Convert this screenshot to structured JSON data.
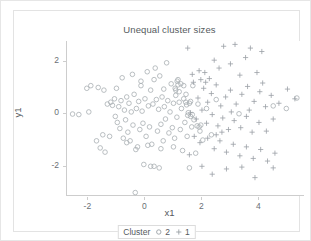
{
  "chart_data": {
    "type": "scatter",
    "title": "Unequal cluster sizes",
    "xlabel": "x1",
    "ylabel": "y1",
    "xlim": [
      -2.75,
      5.6
    ],
    "ylim": [
      -3.15,
      2.75
    ],
    "grid": false,
    "xticks": [
      "-2",
      "0",
      "2",
      "4"
    ],
    "xtick_values": [
      -2,
      0,
      2,
      4
    ],
    "yticks": [
      "2",
      "0",
      "-2"
    ],
    "ytick_values": [
      2,
      0,
      -2
    ],
    "legend": {
      "title": "Cluster",
      "position": "bottom",
      "entries": [
        {
          "label": "2",
          "marker": "circle",
          "color": "#9aa0a6"
        },
        {
          "label": "1",
          "marker": "plus",
          "color": "#9aa0a6"
        }
      ]
    },
    "series": [
      {
        "name": "2",
        "marker": "circle",
        "color": "#a8aeb3",
        "points": [
          [
            -2.52,
            -0.03
          ],
          [
            -2.3,
            -0.05
          ],
          [
            -2.02,
            0.95
          ],
          [
            -1.88,
            1.05
          ],
          [
            -1.62,
            0.98
          ],
          [
            -1.55,
            -1.32
          ],
          [
            -1.46,
            -0.82
          ],
          [
            -1.42,
            0.88
          ],
          [
            -1.38,
            -1.48
          ],
          [
            -1.3,
            0.35
          ],
          [
            -1.22,
            -0.88
          ],
          [
            -1.18,
            0.42
          ],
          [
            -1.12,
            0.3
          ],
          [
            -1.05,
            0.55
          ],
          [
            -1.02,
            -0.12
          ],
          [
            -0.98,
            0.95
          ],
          [
            -0.95,
            -0.35
          ],
          [
            -0.9,
            0.25
          ],
          [
            -0.86,
            -0.58
          ],
          [
            -0.82,
            0.48
          ],
          [
            -0.78,
            1.35
          ],
          [
            -0.74,
            -0.95
          ],
          [
            -0.7,
            0.12
          ],
          [
            -0.66,
            -0.25
          ],
          [
            -0.62,
            0.62
          ],
          [
            -0.58,
            -0.72
          ],
          [
            -0.54,
            0.38
          ],
          [
            -0.5,
            -1.05
          ],
          [
            -0.46,
            0.05
          ],
          [
            -0.42,
            1.48
          ],
          [
            -0.4,
            -0.45
          ],
          [
            -0.36,
            0.72
          ],
          [
            -0.32,
            -3.02
          ],
          [
            -0.28,
            0.18
          ],
          [
            -0.24,
            -1.28
          ],
          [
            -0.2,
            0.45
          ],
          [
            -0.16,
            -0.62
          ],
          [
            -0.12,
            1.22
          ],
          [
            -0.08,
            0.08
          ],
          [
            -0.05,
            -0.38
          ],
          [
            -0.02,
            -1.95
          ],
          [
            0.02,
            0.55
          ],
          [
            0.06,
            -0.88
          ],
          [
            0.1,
            1.58
          ],
          [
            0.14,
            0.28
          ],
          [
            0.18,
            -0.52
          ],
          [
            0.22,
            0.88
          ],
          [
            0.26,
            -1.18
          ],
          [
            0.3,
            0.35
          ],
          [
            0.34,
            -2.02
          ],
          [
            0.38,
            1.72
          ],
          [
            0.42,
            0.52
          ],
          [
            0.46,
            -0.68
          ],
          [
            0.5,
            0.15
          ],
          [
            0.54,
            1.42
          ],
          [
            0.58,
            -0.42
          ],
          [
            0.62,
            0.62
          ],
          [
            0.66,
            -1.05
          ],
          [
            0.7,
            0.25
          ],
          [
            0.74,
            -0.22
          ],
          [
            0.78,
            1.92
          ],
          [
            0.82,
            0.48
          ],
          [
            0.86,
            -0.75
          ],
          [
            0.9,
            0.05
          ],
          [
            0.94,
            1.12
          ],
          [
            0.98,
            -0.55
          ],
          [
            1.02,
            0.38
          ],
          [
            1.06,
            -0.95
          ],
          [
            1.1,
            0.68
          ],
          [
            1.14,
            -0.15
          ],
          [
            1.18,
            1.28
          ],
          [
            1.22,
            0.42
          ],
          [
            1.26,
            -0.62
          ],
          [
            1.3,
            0.18
          ],
          [
            1.34,
            -1.42
          ],
          [
            1.38,
            0.55
          ],
          [
            1.42,
            -0.35
          ],
          [
            1.46,
            0.72
          ],
          [
            1.5,
            -0.88
          ],
          [
            1.54,
            0.02
          ],
          [
            1.58,
            -2.08
          ],
          [
            1.62,
            0.45
          ],
          [
            1.66,
            -0.52
          ],
          [
            1.7,
            1.05
          ],
          [
            1.74,
            -0.25
          ],
          [
            1.8,
            -1.52
          ],
          [
            1.88,
            0.35
          ],
          [
            1.95,
            -0.68
          ],
          [
            2.05,
            -1.02
          ],
          [
            2.18,
            0.18
          ],
          [
            2.35,
            -0.82
          ],
          [
            2.52,
            0.52
          ],
          [
            3.32,
            -0.02
          ],
          [
            4.52,
            0.28
          ],
          [
            4.98,
            0.18
          ],
          [
            5.35,
            0.58
          ],
          [
            -0.62,
            -1.12
          ],
          [
            -0.3,
            -1.38
          ],
          [
            0.12,
            -1.22
          ],
          [
            0.58,
            -1.35
          ],
          [
            1.02,
            -1.28
          ],
          [
            -1.68,
            -1.05
          ],
          [
            -1.95,
            0.05
          ],
          [
            0.22,
            -2.02
          ],
          [
            0.52,
            -2.08
          ],
          [
            -0.12,
            1.05
          ],
          [
            0.34,
            1.28
          ],
          [
            0.68,
            0.92
          ],
          [
            1.08,
            0.95
          ],
          [
            1.18,
            1.08
          ],
          [
            1.22,
            0.82
          ],
          [
            1.28,
            1.12
          ],
          [
            1.38,
            1.05
          ],
          [
            1.45,
            0.42
          ],
          [
            1.48,
            0.32
          ],
          [
            1.58,
            0.38
          ],
          [
            1.52,
            -0.08
          ],
          [
            1.62,
            -0.12
          ],
          [
            1.68,
            -0.05
          ],
          [
            1.85,
            -0.48
          ],
          [
            1.92,
            -0.52
          ],
          [
            1.98,
            -0.45
          ],
          [
            1.15,
            1.22
          ],
          [
            1.1,
            0.88
          ]
        ]
      },
      {
        "name": "1",
        "marker": "plus",
        "color": "#9aa0a6",
        "points": [
          [
            1.52,
            2.48
          ],
          [
            1.92,
            1.62
          ],
          [
            2.28,
            1.32
          ],
          [
            2.45,
            2.02
          ],
          [
            2.62,
            1.72
          ],
          [
            2.78,
            2.55
          ],
          [
            3.02,
            1.88
          ],
          [
            3.18,
            2.62
          ],
          [
            3.35,
            1.45
          ],
          [
            3.55,
            2.12
          ],
          [
            3.72,
            2.48
          ],
          [
            3.95,
            1.55
          ],
          [
            4.12,
            2.35
          ],
          [
            1.72,
            1.18
          ],
          [
            1.88,
            0.58
          ],
          [
            2.08,
            0.95
          ],
          [
            2.22,
            0.42
          ],
          [
            2.35,
            0.75
          ],
          [
            2.52,
            1.08
          ],
          [
            2.68,
            0.28
          ],
          [
            2.85,
            0.62
          ],
          [
            3.02,
            0.88
          ],
          [
            3.22,
            0.35
          ],
          [
            3.42,
            0.72
          ],
          [
            3.62,
            1.02
          ],
          [
            3.85,
            0.45
          ],
          [
            4.05,
            0.82
          ],
          [
            4.25,
            0.25
          ],
          [
            4.45,
            0.68
          ],
          [
            4.72,
            0.38
          ],
          [
            5.02,
            0.92
          ],
          [
            5.28,
            0.55
          ],
          [
            1.62,
            0.02
          ],
          [
            1.82,
            -0.22
          ],
          [
            2.02,
            0.12
          ],
          [
            2.18,
            -0.38
          ],
          [
            2.38,
            -0.05
          ],
          [
            2.58,
            -0.48
          ],
          [
            2.75,
            -0.18
          ],
          [
            2.95,
            -0.62
          ],
          [
            3.15,
            -0.28
          ],
          [
            3.38,
            -0.55
          ],
          [
            3.58,
            -0.12
          ],
          [
            3.78,
            -0.72
          ],
          [
            4.02,
            -0.35
          ],
          [
            4.28,
            -0.68
          ],
          [
            4.52,
            -0.22
          ],
          [
            1.75,
            -0.88
          ],
          [
            1.95,
            -1.12
          ],
          [
            2.22,
            -0.95
          ],
          [
            2.45,
            -1.35
          ],
          [
            2.65,
            -1.05
          ],
          [
            2.88,
            -1.48
          ],
          [
            3.12,
            -1.18
          ],
          [
            3.35,
            -1.62
          ],
          [
            3.58,
            -1.28
          ],
          [
            3.82,
            -1.72
          ],
          [
            4.08,
            -1.38
          ],
          [
            4.32,
            -1.82
          ],
          [
            4.58,
            -1.52
          ],
          [
            2.02,
            -2.02
          ],
          [
            2.38,
            -2.32
          ],
          [
            2.88,
            -2.12
          ],
          [
            3.42,
            -2.05
          ],
          [
            3.88,
            -2.45
          ],
          [
            4.52,
            -2.08
          ],
          [
            1.68,
            1.48
          ],
          [
            2.12,
            1.55
          ],
          [
            2.52,
            -0.82
          ],
          [
            3.05,
            0.05
          ],
          [
            3.68,
            0.12
          ],
          [
            4.15,
            1.15
          ],
          [
            1.58,
            -1.58
          ],
          [
            2.72,
            -0.72
          ],
          [
            2.15,
            1.18
          ],
          [
            1.98,
            1.28
          ]
        ]
      }
    ]
  }
}
